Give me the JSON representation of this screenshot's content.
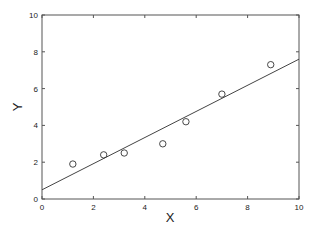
{
  "chart_data": {
    "type": "scatter",
    "title": "",
    "xlabel": "X",
    "ylabel": "Y",
    "xlim": [
      0,
      10
    ],
    "ylim": [
      0,
      10
    ],
    "grid": false,
    "legend": null,
    "x_ticks": [
      "0",
      "2",
      "4",
      "6",
      "8",
      "10"
    ],
    "y_ticks": [
      "0",
      "2",
      "4",
      "6",
      "8",
      "10"
    ],
    "series": [
      {
        "name": "data",
        "kind": "scatter",
        "marker": "open-circle",
        "points": [
          {
            "x": 1.2,
            "y": 1.9
          },
          {
            "x": 2.4,
            "y": 2.4
          },
          {
            "x": 3.2,
            "y": 2.5
          },
          {
            "x": 4.7,
            "y": 3.0
          },
          {
            "x": 5.6,
            "y": 4.2
          },
          {
            "x": 7.0,
            "y": 5.7
          },
          {
            "x": 8.9,
            "y": 7.3
          }
        ]
      },
      {
        "name": "linear fit",
        "kind": "line",
        "points": [
          {
            "x": 0,
            "y": 0.5
          },
          {
            "x": 10,
            "y": 7.6
          }
        ]
      }
    ],
    "colors": {
      "axis": "#555555",
      "marker": "#333333",
      "line": "#444444"
    }
  }
}
